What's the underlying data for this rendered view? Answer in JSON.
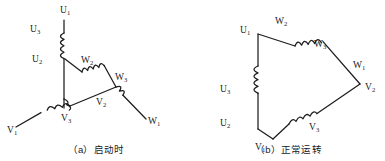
{
  "figure": {
    "background_color": "#ffffff",
    "line_color": "#1d1d1d",
    "text_color": "#1a1a1a",
    "panels": [
      {
        "id": "a",
        "caption": "（a）启动时",
        "connection_type": "star",
        "labels": [
          {
            "name": "U1",
            "base": "U",
            "sub": "1",
            "x": 60,
            "y": 13
          },
          {
            "name": "U3",
            "base": "U",
            "sub": "3",
            "x": 30,
            "y": 32
          },
          {
            "name": "U2",
            "base": "U",
            "sub": "2",
            "x": 32,
            "y": 62
          },
          {
            "name": "W2",
            "base": "W",
            "sub": "2",
            "x": 81,
            "y": 63
          },
          {
            "name": "W3",
            "base": "W",
            "sub": "3",
            "x": 115,
            "y": 80
          },
          {
            "name": "V2",
            "base": "V",
            "sub": "2",
            "x": 96,
            "y": 105
          },
          {
            "name": "V3",
            "base": "V",
            "sub": "3",
            "x": 61,
            "y": 121
          },
          {
            "name": "V1",
            "base": "V",
            "sub": "1",
            "x": 7,
            "y": 133
          },
          {
            "name": "W1",
            "base": "W",
            "sub": "1",
            "x": 148,
            "y": 124
          }
        ]
      },
      {
        "id": "b",
        "caption": "（b）正常运转",
        "connection_type": "delta",
        "labels": [
          {
            "name": "U1",
            "base": "U",
            "sub": "1",
            "x": 54,
            "y": 33
          },
          {
            "name": "W2",
            "base": "W",
            "sub": "2",
            "x": 83,
            "y": 24
          },
          {
            "name": "W3",
            "base": "W",
            "sub": "3",
            "x": 122,
            "y": 47
          },
          {
            "name": "W1",
            "base": "W",
            "sub": "1",
            "x": 163,
            "y": 68
          },
          {
            "name": "V2",
            "base": "V",
            "sub": "2",
            "x": 173,
            "y": 90
          },
          {
            "name": "U3",
            "base": "U",
            "sub": "3",
            "x": 28,
            "y": 92
          },
          {
            "name": "U2",
            "base": "U",
            "sub": "2",
            "x": 28,
            "y": 126
          },
          {
            "name": "V1",
            "base": "V",
            "sub": "1",
            "x": 63,
            "y": 140
          },
          {
            "name": "V3",
            "base": "V",
            "sub": "3",
            "x": 117,
            "y": 125
          }
        ]
      }
    ]
  }
}
